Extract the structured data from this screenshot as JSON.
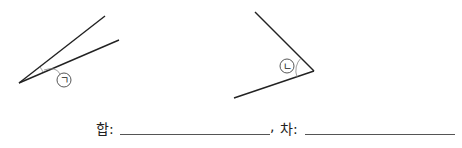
{
  "figures": {
    "angle_a": {
      "label": "ㄱ",
      "vertex": [
        19,
        83
      ],
      "arm1_end": [
        105,
        16
      ],
      "arm2_end": [
        119,
        40
      ],
      "label_pos": [
        64,
        80
      ]
    },
    "angle_b": {
      "label": "ㄴ",
      "vertex": [
        314,
        71
      ],
      "arm1_end": [
        255,
        12
      ],
      "arm2_end": [
        234,
        98
      ],
      "label_pos": [
        287,
        66
      ]
    }
  },
  "answer": {
    "sum_label": "합:",
    "comma": ",",
    "diff_label": "차:",
    "sum_value": "",
    "diff_value": ""
  }
}
